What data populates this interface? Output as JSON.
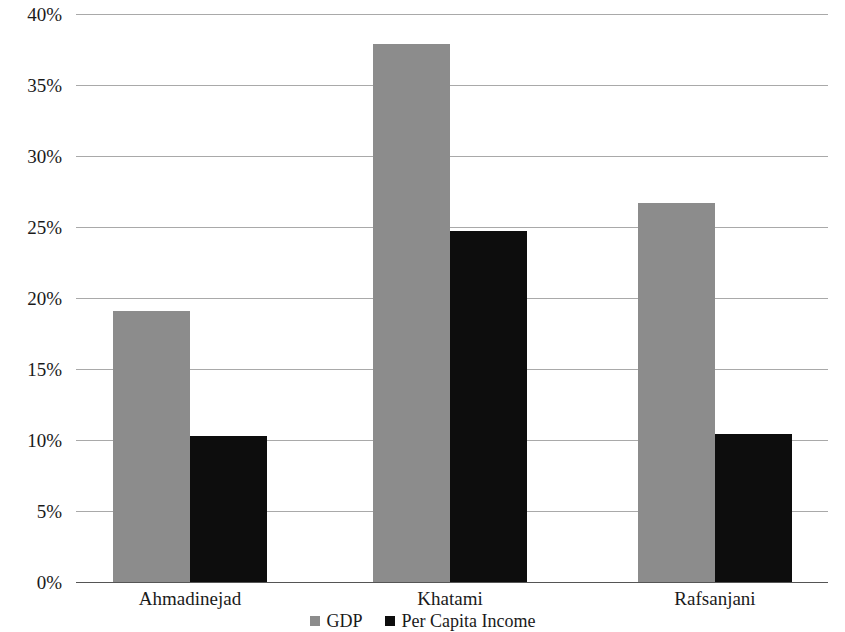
{
  "chart_data": {
    "type": "bar",
    "title": "",
    "subtitle": "",
    "xlabel": "",
    "ylabel": "",
    "categories": [
      "Ahmadinejad",
      "Khatami",
      "Rafsanjani"
    ],
    "series": [
      {
        "name": "GDP",
        "color": "#8c8c8c",
        "values": [
          19.1,
          37.9,
          26.7
        ]
      },
      {
        "name": "Per Capita Income",
        "color": "#0d0d0d",
        "values": [
          10.3,
          24.7,
          10.4
        ]
      }
    ],
    "ylim": [
      0,
      40
    ],
    "ytick_values": [
      0,
      5,
      10,
      15,
      20,
      25,
      30,
      35,
      40
    ],
    "ytick_labels": [
      "0%",
      "5%",
      "10%",
      "15%",
      "20%",
      "25%",
      "30%",
      "35%",
      "40%"
    ],
    "grid": true,
    "grid_axis": "y",
    "grid_color": "#9a9a9a",
    "legend": {
      "position": "bottom",
      "entries": [
        {
          "label": "GDP",
          "color": "#8c8c8c",
          "swatch": "gray-square-swatch"
        },
        {
          "label": "Per Capita Income",
          "color": "#0d0d0d",
          "swatch": "black-square-swatch"
        }
      ]
    },
    "background_color": "#ffffff",
    "text_color": "#1a1a1a"
  }
}
